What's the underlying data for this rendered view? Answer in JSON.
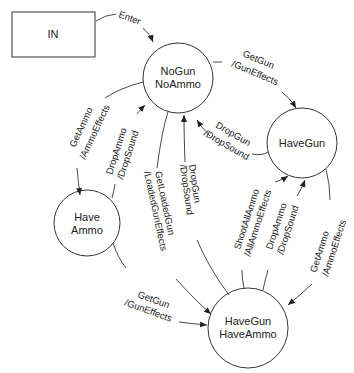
{
  "diagram": {
    "type": "state-machine",
    "nodes": {
      "in": {
        "label": "IN",
        "shape": "rectangle"
      },
      "nogun_noammo": {
        "line1": "NoGun",
        "line2": "NoAmmo",
        "shape": "circle"
      },
      "havegun": {
        "label": "HaveGun",
        "shape": "circle"
      },
      "haveammo": {
        "line1": "Have",
        "line2": "Ammo",
        "shape": "circle"
      },
      "havegun_haveammo": {
        "line1": "HaveGun",
        "line2": "HaveAmmo",
        "shape": "circle"
      }
    },
    "edges": {
      "enter": {
        "from": "IN",
        "to": "NoGun NoAmmo",
        "event": "Enter"
      },
      "nogun_to_havegun": {
        "from": "NoGun NoAmmo",
        "to": "HaveGun",
        "event": "GetGun",
        "action": "/GunEffects"
      },
      "havegun_to_nogun": {
        "from": "HaveGun",
        "to": "NoGun NoAmmo",
        "event": "DropGun",
        "action": "/DropSound"
      },
      "nogun_to_haveammo": {
        "from": "NoGun NoAmmo",
        "to": "Have Ammo",
        "event": "GetAmmo",
        "action": "/AmmoEffects"
      },
      "haveammo_to_nogun": {
        "from": "Have Ammo",
        "to": "NoGun NoAmmo",
        "event": "DropAmmo",
        "action": "/DropSound"
      },
      "nogun_to_both": {
        "from": "NoGun NoAmmo",
        "to": "HaveGun HaveAmmo",
        "event": "GetLoadedGun",
        "action": "/LoadedGunEffects"
      },
      "both_to_nogun": {
        "from": "HaveGun HaveAmmo",
        "to": "NoGun NoAmmo",
        "event": "DropGun",
        "action": "/DropSound"
      },
      "both_to_havegun_shoot": {
        "from": "HaveGun HaveAmmo",
        "to": "HaveGun",
        "event": "ShootAllAmmo",
        "action": "/AllAmmoEffects"
      },
      "both_to_havegun_drop": {
        "from": "HaveGun HaveAmmo",
        "to": "HaveGun",
        "event": "DropAmmo",
        "action": "/DropSound"
      },
      "havegun_to_both": {
        "from": "HaveGun",
        "to": "HaveGun HaveAmmo",
        "event": "GetAmmo",
        "action": "/AmmoEffects"
      },
      "haveammo_to_both": {
        "from": "Have Ammo",
        "to": "HaveGun HaveAmmo",
        "event": "GetGun",
        "action": "/GunEffects"
      }
    }
  }
}
